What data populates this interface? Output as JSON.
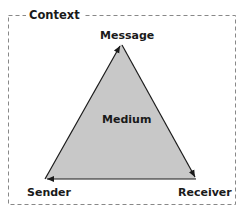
{
  "diagram": {
    "type": "communication-triangle",
    "frame": {
      "label": "Context",
      "style": "dashed"
    },
    "nodes": {
      "top": "Message",
      "bottom_left": "Sender",
      "bottom_right": "Receiver",
      "center": "Medium"
    },
    "edges": [
      {
        "from": "Sender",
        "to": "Message"
      },
      {
        "from": "Message",
        "to": "Receiver"
      },
      {
        "from": "Receiver",
        "to": "Sender"
      }
    ],
    "colors": {
      "fill": "#c8c8c8",
      "stroke": "#1a1a1a",
      "frame": "#888888"
    }
  }
}
